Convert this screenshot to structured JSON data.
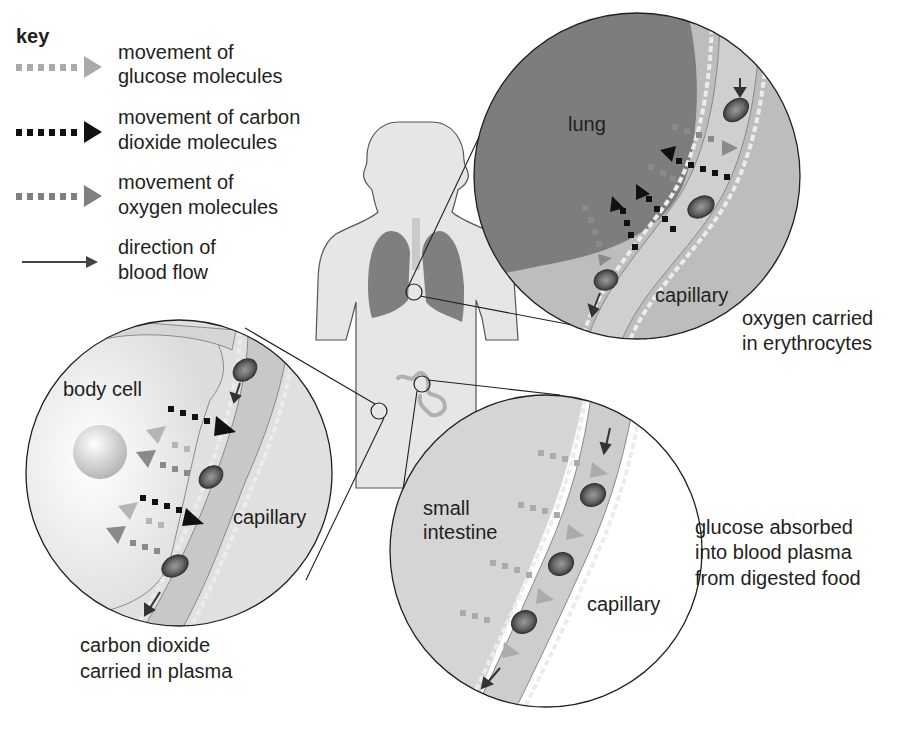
{
  "key": {
    "title": "key",
    "items": [
      {
        "line1": "movement of",
        "line2": "glucose molecules",
        "icon": "dotted-arrow-light-grey",
        "color": "#aaaaaa"
      },
      {
        "line1": "movement of carbon",
        "line2": "dioxide molecules",
        "icon": "dotted-arrow-black",
        "color": "#111111"
      },
      {
        "line1": "movement of",
        "line2": "oxygen molecules",
        "icon": "dotted-arrow-mid-grey",
        "color": "#7f7f7f"
      },
      {
        "line1": "direction of",
        "line2": "blood flow",
        "icon": "solid-arrow",
        "color": "#444444"
      }
    ]
  },
  "lung_panel": {
    "tissue_label": "lung",
    "vessel_label": "capillary",
    "caption_line1": "oxygen carried",
    "caption_line2": "in erythrocytes"
  },
  "body_cell_panel": {
    "tissue_label": "body cell",
    "vessel_label": "capillary",
    "caption_line1": "carbon dioxide",
    "caption_line2": "carried in plasma"
  },
  "intestine_panel": {
    "tissue_label_line1": "small",
    "tissue_label_line2": "intestine",
    "vessel_label": "capillary",
    "caption_line1": "glucose absorbed",
    "caption_line2": "into blood plasma",
    "caption_line3": "from digested food"
  },
  "colors": {
    "body_fill": "#e6e6e6",
    "lung_fill": "#7d7d7d",
    "tissue_fill": "#d9d9d9",
    "capillary_fill": "#c8c8c8",
    "outline": "#231f20",
    "glucose": "#aaaaaa",
    "carbon_dioxide": "#111111",
    "oxygen": "#7f7f7f"
  }
}
